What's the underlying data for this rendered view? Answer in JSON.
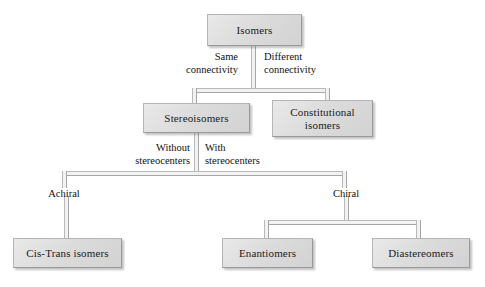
{
  "diagram": {
    "nodes": [
      {
        "id": "isomers",
        "label": "Isomers"
      },
      {
        "id": "stereoisomers",
        "label": "Stereoisomers"
      },
      {
        "id": "constitutional",
        "label": "Constitutional",
        "label2": "isomers"
      },
      {
        "id": "cistrans",
        "label": "Cis-Trans isomers"
      },
      {
        "id": "enantiomers",
        "label": "Enantiomers"
      },
      {
        "id": "diastereomers",
        "label": "Diastereomers"
      }
    ],
    "edge_labels": [
      {
        "id": "same-connectivity",
        "line1": "Same",
        "line2": "connectivity"
      },
      {
        "id": "different-connectivity",
        "line1": "Different",
        "line2": "connectivity"
      },
      {
        "id": "without-stereocenters",
        "line1": "Without",
        "line2": "stereocenters"
      },
      {
        "id": "with-stereocenters",
        "line1": "With",
        "line2": "stereocenters"
      },
      {
        "id": "achiral",
        "line1": "Achiral"
      },
      {
        "id": "chiral",
        "line1": "Chiral"
      }
    ],
    "colors": {
      "box_fill_light": "#e9e9e9",
      "box_fill_dark": "#d2d2d2",
      "box_border": "#9a9a9a",
      "line": "#b0b0b0",
      "text": "#1a1a1a",
      "background": "#ffffff"
    }
  }
}
